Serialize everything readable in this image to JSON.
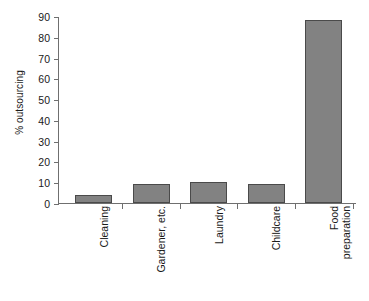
{
  "chart_data": {
    "type": "bar",
    "title": "",
    "xlabel": "",
    "ylabel": "% outsourcing",
    "categories": [
      "Cleaning",
      "Gardener, etc.",
      "Laundry",
      "Childcare",
      "Food\npreparation"
    ],
    "values": [
      4,
      9,
      10,
      9,
      88
    ],
    "ylim": [
      0,
      90
    ],
    "ytick_step": 10,
    "yticks": [
      0,
      10,
      20,
      30,
      40,
      50,
      60,
      70,
      80,
      90
    ],
    "ytick_labels": [
      "0",
      "10",
      "20",
      "30",
      "40",
      "50",
      "60",
      "70",
      "80",
      "90"
    ],
    "grid": false,
    "legend": null,
    "bar_color": "#828282",
    "bar_border_color": "#4a4a4a",
    "axis_color": "#6f6f6f"
  }
}
